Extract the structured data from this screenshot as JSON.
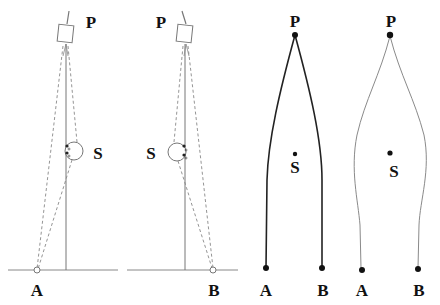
{
  "colors": {
    "background": "#ffffff",
    "ink": "#111111",
    "pole": "#777777",
    "dashed": "#888888",
    "curve_gray": "#8a8a8a"
  },
  "panels": [
    {
      "id": "panel-1",
      "kind": "apparatus",
      "labels": {
        "top": "P",
        "middle": "S",
        "bottom": "A"
      }
    },
    {
      "id": "panel-2",
      "kind": "apparatus",
      "labels": {
        "top": "P",
        "middle": "S",
        "bottom": "B"
      }
    },
    {
      "id": "panel-3",
      "kind": "straight-paths",
      "labels": {
        "top": "P",
        "middle": "S",
        "bottom_left": "A",
        "bottom_right": "B"
      }
    },
    {
      "id": "panel-4",
      "kind": "curved-paths",
      "labels": {
        "top": "P",
        "middle": "S",
        "bottom_left": "A",
        "bottom_right": "B"
      }
    }
  ]
}
